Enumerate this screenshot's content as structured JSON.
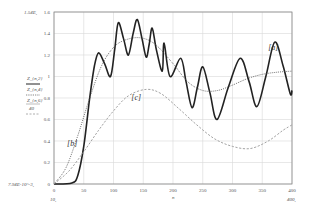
{
  "chart_data": {
    "type": "line",
    "title": "",
    "xlabel": "n",
    "ylabel": "Z_{n,2} / Z_{n,4} (solid), Z_{n,6} (dotted), Z_{n,6}/40 (dashed)",
    "xlim": [
      0,
      400
    ],
    "ylim": [
      0,
      1.6
    ],
    "grid": true,
    "x_ticks": [
      "0",
      "50",
      "100",
      "150",
      "200",
      "250",
      "300",
      "350",
      "400"
    ],
    "y_ticks": [
      "0",
      "0.2",
      "0.4",
      "0.6",
      "0.8",
      "1",
      "1.2",
      "1.4",
      "1.6"
    ],
    "axis_annotations": {
      "y_top": "1.54E,",
      "y_bottom": "7.94E-10^-3,",
      "x_left": "10,",
      "x_right": "400,",
      "x_var": "n"
    },
    "legend": {
      "position": "left-margin",
      "entries": [
        "Z_{n,2}",
        "Z_{n,4}",
        "Z_{n,6}",
        "40"
      ]
    },
    "series": [
      {
        "name": "[a]",
        "style": "solid",
        "color": "#222222",
        "x": [
          0,
          30,
          40,
          50,
          60,
          68,
          75,
          85,
          95,
          102,
          108,
          117,
          125,
          133,
          140,
          148,
          155,
          160,
          165,
          172,
          182,
          185,
          195,
          213,
          222,
          232,
          241,
          250,
          262,
          274,
          293,
          313,
          328,
          341,
          356,
          371,
          385,
          397,
          400
        ],
        "y": [
          0,
          0.01,
          0.08,
          0.35,
          0.8,
          1.1,
          1.22,
          1.12,
          1.0,
          1.25,
          1.5,
          1.35,
          1.2,
          1.4,
          1.53,
          1.35,
          1.18,
          1.3,
          1.45,
          1.25,
          1.05,
          1.31,
          1.0,
          1.17,
          0.95,
          0.71,
          0.9,
          1.09,
          0.85,
          0.6,
          0.9,
          1.17,
          0.95,
          0.72,
          1.0,
          1.32,
          1.1,
          0.84,
          0.87
        ]
      },
      {
        "name": "[b]",
        "style": "dotted",
        "color": "#444444",
        "x": [
          0,
          20,
          40,
          60,
          80,
          100,
          120,
          145,
          170,
          200,
          225,
          250,
          275,
          300,
          325,
          350,
          375,
          400
        ],
        "y": [
          0,
          0.15,
          0.45,
          0.8,
          1.1,
          1.27,
          1.34,
          1.36,
          1.3,
          1.12,
          0.95,
          0.87,
          0.87,
          0.92,
          0.98,
          1.02,
          1.04,
          1.05
        ]
      },
      {
        "name": "[c]",
        "style": "dashed",
        "color": "#999999",
        "x": [
          0,
          25,
          50,
          75,
          100,
          125,
          155,
          180,
          210,
          240,
          270,
          300,
          330,
          360,
          385,
          400
        ],
        "y": [
          0,
          0.12,
          0.3,
          0.5,
          0.68,
          0.82,
          0.88,
          0.84,
          0.7,
          0.55,
          0.42,
          0.35,
          0.33,
          0.4,
          0.5,
          0.55
        ]
      }
    ],
    "annotations": [
      {
        "text": "[a]",
        "x": 360,
        "y": 1.25
      },
      {
        "text": "[b]",
        "x": 22,
        "y": 0.35
      },
      {
        "text": "[c]",
        "x": 130,
        "y": 0.78
      }
    ]
  }
}
